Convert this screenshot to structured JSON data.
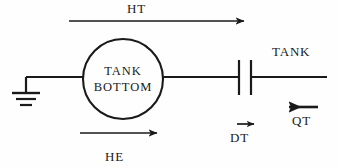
{
  "diagram": {
    "background_color": "#fefefe",
    "stroke_color": "#1a1a1a",
    "node": {
      "shape": "circle",
      "label_line1": "TANK",
      "label_line2": "BOTTOM",
      "center_x": 123,
      "center_y": 79,
      "radius": 40
    },
    "labels": {
      "ht": "HT",
      "he": "HE",
      "dt": "DT",
      "qt": "QT",
      "tank": "TANK"
    },
    "elements": {
      "ground_symbol": "earth-ground",
      "capacitor_symbol": "capacitor",
      "arrow_ht_direction": "right",
      "arrow_he_direction": "right",
      "arrow_dt_direction": "right",
      "arrow_qt_direction": "left"
    }
  }
}
